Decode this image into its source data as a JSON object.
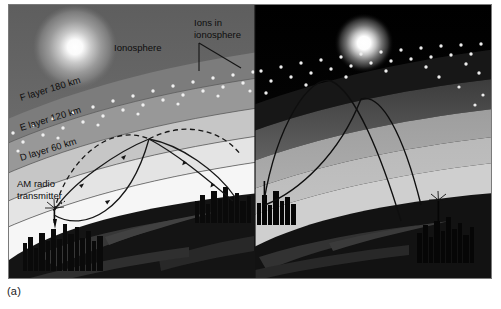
{
  "figure": {
    "caption": "(a)",
    "panels": [
      {
        "name": "daytime-panel",
        "sky_body": "sun",
        "labels": [
          {
            "id": "ionosphere",
            "text": "Ionosphere"
          },
          {
            "id": "ions-line1",
            "text": "Ions in"
          },
          {
            "id": "ions-line2",
            "text": "ionosphere"
          },
          {
            "id": "f-layer",
            "text": "F layer  180 km"
          },
          {
            "id": "e-layer",
            "text": "E layer  120 km"
          },
          {
            "id": "d-layer",
            "text": "D layer  60 km"
          },
          {
            "id": "transmitter-l1",
            "text": "AM radio"
          },
          {
            "id": "transmitter-l2",
            "text": "transmitter"
          }
        ],
        "layers": [
          {
            "name": "F layer",
            "altitude": "180 km"
          },
          {
            "name": "E layer",
            "altitude": "120 km"
          },
          {
            "name": "D layer",
            "altitude": "60 km"
          }
        ],
        "wave_paths": [
          {
            "style": "solid",
            "reflects_at": "D layer"
          },
          {
            "style": "dashed",
            "reflects_at": "E layer"
          }
        ]
      },
      {
        "name": "nighttime-panel",
        "sky_body": "moon",
        "labels": [],
        "wave_paths": [
          {
            "style": "solid",
            "reflects_at": "F layer"
          },
          {
            "style": "solid",
            "reflects_at": "F layer"
          }
        ]
      }
    ]
  },
  "colors": {
    "sky_day": "#6e6e6e",
    "sky_night": "#000000",
    "f_layer": "#8f8f8f",
    "e_layer": "#c9c9c9",
    "d_layer": "#ededed",
    "troposphere": "#f7f7f7",
    "earth": "#1a1a1a",
    "ion_dot": "#f2f2f2",
    "border": "#7a7a7a",
    "text": "#0d0d0d",
    "wave": "#1b1b1b"
  }
}
